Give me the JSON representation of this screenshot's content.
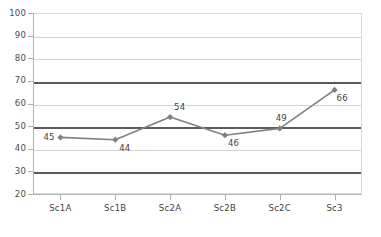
{
  "chart_data": {
    "type": "line",
    "title": "",
    "subtitle": "",
    "xlabel": "",
    "ylabel": "",
    "categories": [
      "Sc1A",
      "Sc1B",
      "Sc2A",
      "Sc2B",
      "Sc2C",
      "Sc3"
    ],
    "values": [
      45,
      44,
      54,
      46,
      49,
      66
    ],
    "point_labels": [
      "45",
      "44",
      "54",
      "46",
      "49",
      "66"
    ],
    "ylim": [
      20,
      100
    ],
    "yticks": [
      100,
      90,
      80,
      70,
      60,
      50,
      40,
      30,
      20
    ],
    "ytick_labels": [
      "100",
      "90",
      "80",
      "70",
      "60",
      "50",
      "40",
      "30",
      "20"
    ],
    "emphasized_gridlines": [
      70,
      50,
      30
    ],
    "grid": true,
    "legend": "none",
    "series_color": "#808080",
    "marker": "diamond",
    "gridline_color": "#d2d2d2",
    "emphasized_gridline_color": "#5a5a5a",
    "axis_color": "#b4b4b4",
    "text_color": "#3f3f3f"
  }
}
